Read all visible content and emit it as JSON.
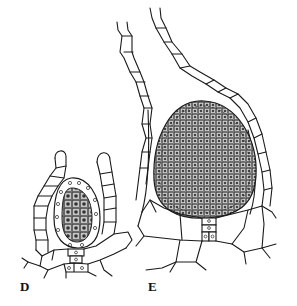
{
  "figure": {
    "type": "botanical line drawing",
    "panels": [
      {
        "id": "D",
        "label": "D",
        "description": "young antheridium with sterile jacket, stalk and enclosing paraphyses"
      },
      {
        "id": "E",
        "label": "E",
        "description": "mature antheridium with dense spermatogenous tissue, stalk and long filamentous paraphyses"
      }
    ],
    "colors": {
      "ink": "#1a1a1a",
      "background": "#ffffff",
      "stipple": "#555555"
    }
  }
}
